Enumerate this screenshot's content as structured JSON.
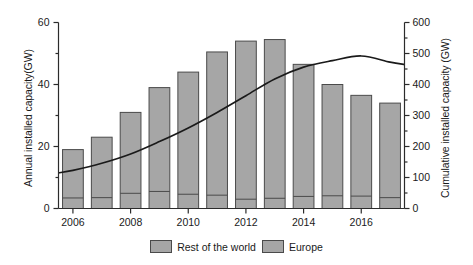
{
  "chart_data": {
    "type": "bar",
    "title": "",
    "xlabel": "",
    "ylabel": "Annual installed capacity(GW)",
    "y2label": "Cumulative installed capacity (GW)",
    "categories": [
      "2006",
      "2007",
      "2008",
      "2009",
      "2010",
      "2011",
      "2012",
      "2013",
      "2014",
      "2015",
      "2016",
      "2017"
    ],
    "x_tick_labels": [
      "2006",
      "2008",
      "2010",
      "2012",
      "2014",
      "2016"
    ],
    "ylim": [
      0,
      60
    ],
    "y_ticks": [
      0,
      20,
      40,
      60
    ],
    "y_minor_ticks": [
      10,
      30,
      50
    ],
    "y2lim": [
      0,
      600
    ],
    "y2_ticks": [
      0,
      100,
      200,
      300,
      400,
      500,
      600
    ],
    "grid": false,
    "legend_position": "bottom-center",
    "series": [
      {
        "name": "Europe",
        "kind": "bar-segment",
        "color": "#a6a6a6",
        "values": [
          3.4,
          3.5,
          4.9,
          5.5,
          4.6,
          4.3,
          3.0,
          3.3,
          3.9,
          4.1,
          4.0,
          3.5
        ]
      },
      {
        "name": "Rest of the world",
        "kind": "bar-segment",
        "color": "#a6a6a6",
        "values": [
          15.6,
          19.5,
          26.1,
          33.5,
          39.4,
          46.2,
          51.0,
          51.2,
          42.6,
          35.9,
          32.5,
          30.5
        ]
      },
      {
        "name": "Total annual installed capacity",
        "kind": "bar-total",
        "values": [
          19.0,
          23.0,
          31.0,
          39.0,
          44.0,
          50.5,
          54.0,
          54.5,
          46.5,
          40.0,
          36.5,
          34.0
        ]
      },
      {
        "name": "Cumulative installed capacity",
        "kind": "line",
        "axis": "right",
        "color": "#1a1a1a",
        "values": [
          123,
          146,
          176,
          216,
          260,
          310,
          364,
          418,
          456,
          477,
          492,
          472
        ]
      }
    ]
  },
  "legend": {
    "items": [
      {
        "label": "Rest of the world",
        "color": "#a6a6a6"
      },
      {
        "label": "Europe",
        "color": "#a6a6a6"
      }
    ]
  },
  "axes": {
    "left_title": "Annual installed capacity(GW)",
    "right_title": "Cumulative installed capacity (GW)",
    "left_ticks": [
      "0",
      "20",
      "40",
      "60"
    ],
    "right_ticks": [
      "0",
      "100",
      "200",
      "300",
      "400",
      "500",
      "600"
    ],
    "x_ticks": [
      "2006",
      "2008",
      "2010",
      "2012",
      "2014",
      "2016"
    ]
  }
}
